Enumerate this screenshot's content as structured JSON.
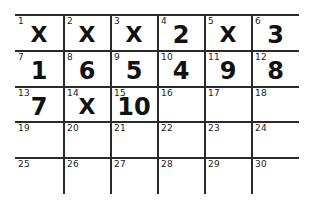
{
  "grid": {
    "rows": 5,
    "cols": 6,
    "cells": [
      {
        "number": "1",
        "value": "X"
      },
      {
        "number": "2",
        "value": "X"
      },
      {
        "number": "3",
        "value": "X"
      },
      {
        "number": "4",
        "value": "2"
      },
      {
        "number": "5",
        "value": "X"
      },
      {
        "number": "6",
        "value": "3"
      },
      {
        "number": "7",
        "value": "1"
      },
      {
        "number": "8",
        "value": "6"
      },
      {
        "number": "9",
        "value": "5"
      },
      {
        "number": "10",
        "value": "4"
      },
      {
        "number": "11",
        "value": "9"
      },
      {
        "number": "12",
        "value": "8"
      },
      {
        "number": "13",
        "value": "7"
      },
      {
        "number": "14",
        "value": "X"
      },
      {
        "number": "15",
        "value": "10"
      },
      {
        "number": "16",
        "value": ""
      },
      {
        "number": "17",
        "value": ""
      },
      {
        "number": "18",
        "value": ""
      },
      {
        "number": "19",
        "value": ""
      },
      {
        "number": "20",
        "value": ""
      },
      {
        "number": "21",
        "value": ""
      },
      {
        "number": "22",
        "value": ""
      },
      {
        "number": "23",
        "value": ""
      },
      {
        "number": "24",
        "value": ""
      },
      {
        "number": "25",
        "value": ""
      },
      {
        "number": "26",
        "value": ""
      },
      {
        "number": "27",
        "value": ""
      },
      {
        "number": "28",
        "value": ""
      },
      {
        "number": "29",
        "value": ""
      },
      {
        "number": "30",
        "value": ""
      }
    ]
  }
}
